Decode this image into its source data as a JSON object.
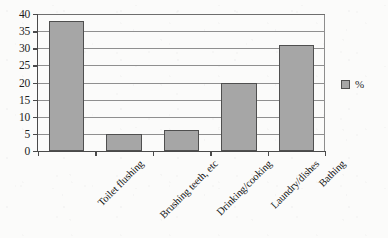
{
  "chart_data": {
    "type": "bar",
    "title": "",
    "xlabel": "",
    "ylabel": "",
    "categories": [
      "Toilet flushing",
      "Brushing teeth, etc",
      "Drinking/cooking",
      "Laundry/dishes",
      "Bathing"
    ],
    "values": [
      38,
      5,
      6,
      20,
      31
    ],
    "series": [
      {
        "name": "%",
        "values": [
          38,
          5,
          6,
          20,
          31
        ]
      }
    ],
    "ylim": [
      0,
      40
    ],
    "ytick_labels": [
      "40",
      "35",
      "30",
      "25",
      "20",
      "15",
      "10",
      "5",
      "0"
    ],
    "ytick_values": [
      40,
      35,
      30,
      25,
      20,
      15,
      10,
      5,
      0
    ],
    "ytick_step": 5,
    "grid": "horizontal",
    "legend_position": "right",
    "legend_entries": [
      "%"
    ],
    "bar_color": "#a6a6a6",
    "bar_border_color": "#4f4f4f",
    "axis_color": "#4a4a4a",
    "gridline_color": "#8f8f8f",
    "background_color": "#fbfbfa",
    "xtick_label_rotation": -45
  },
  "legend": {
    "swatch_name": "percent-series-swatch",
    "label": "%"
  }
}
